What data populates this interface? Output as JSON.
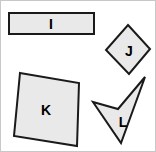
{
  "figure": {
    "background_color": "#ffffff",
    "border_color": "#c8c8c8",
    "fill_color": "#e9e9e9",
    "stroke_color": "#1a1a1a",
    "label_color": "#000000",
    "width": 156,
    "height": 152
  },
  "shapes": [
    {
      "id": "shape-i",
      "label": "I",
      "kind": "rectangle",
      "points": "8,12 93,12 93,33 8,33",
      "label_x": 50,
      "label_y": 23
    },
    {
      "id": "shape-j",
      "label": "J",
      "kind": "diamond",
      "points": "127,24 149,48 128,73 105,49",
      "label_x": 128,
      "label_y": 50
    },
    {
      "id": "shape-k",
      "label": "K",
      "kind": "quadrilateral",
      "points": "19,72 78,82 76,145 13,135",
      "label_x": 45,
      "label_y": 109
    },
    {
      "id": "shape-l",
      "label": "L",
      "kind": "concave-dart",
      "points": "144,76 120,142 92,101 117,108",
      "label_x": 122,
      "label_y": 121
    }
  ]
}
